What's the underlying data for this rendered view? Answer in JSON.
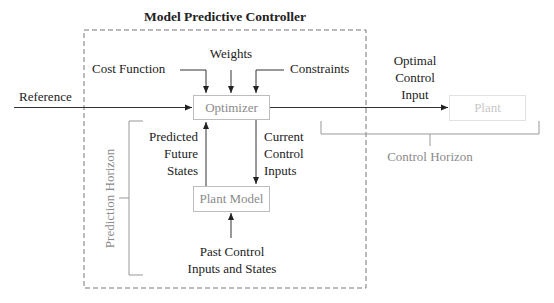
{
  "diagram": {
    "title": "Model Predictive Controller",
    "blocks": {
      "optimizer": "Optimizer",
      "plant_model": "Plant Model",
      "plant": "Plant"
    },
    "inputs": {
      "cost_function": "Cost Function",
      "weights": "Weights",
      "constraints": "Constraints",
      "reference": "Reference"
    },
    "signals": {
      "optimal_control_input": [
        "Optimal",
        "Control",
        "Input"
      ],
      "predicted_future_states": [
        "Predicted",
        "Future",
        "States"
      ],
      "current_control_inputs": [
        "Current",
        "Control",
        "Inputs"
      ],
      "past_control_inputs": [
        "Past Control",
        "Inputs and States"
      ]
    },
    "horizons": {
      "prediction": "Prediction Horizon",
      "control": "Control Horizon"
    },
    "colors": {
      "line": "#333333",
      "dashed_border": "#777777",
      "box_border": "#bdbdbd",
      "muted_text": "#8a8a8a",
      "plant_text": "#c8c8c8"
    }
  }
}
